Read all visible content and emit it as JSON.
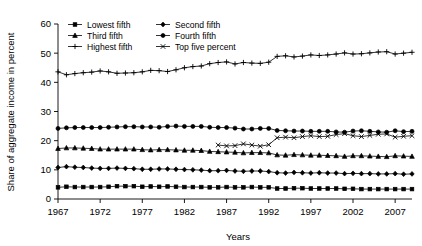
{
  "chart_data": {
    "type": "line",
    "title": "",
    "xlabel": "Years",
    "ylabel": "Share of aggregate income in percent",
    "xlim": [
      1967,
      2009
    ],
    "ylim": [
      0,
      60
    ],
    "grid": false,
    "legend_position": "top-left-inside",
    "xticks": [
      1967,
      1972,
      1977,
      1982,
      1987,
      1992,
      1997,
      2002,
      2007
    ],
    "yticks": [
      0,
      10,
      20,
      30,
      40,
      50,
      60
    ],
    "x": [
      1967,
      1968,
      1969,
      1970,
      1971,
      1972,
      1973,
      1974,
      1975,
      1976,
      1977,
      1978,
      1979,
      1980,
      1981,
      1982,
      1983,
      1984,
      1985,
      1986,
      1987,
      1988,
      1989,
      1990,
      1991,
      1992,
      1993,
      1994,
      1995,
      1996,
      1997,
      1998,
      1999,
      2000,
      2001,
      2002,
      2003,
      2004,
      2005,
      2006,
      2007,
      2008,
      2009
    ],
    "series": [
      {
        "name": "Lowest fifth",
        "marker": "square",
        "values": [
          4.0,
          4.2,
          4.1,
          4.1,
          4.1,
          4.1,
          4.2,
          4.4,
          4.4,
          4.4,
          4.2,
          4.3,
          4.2,
          4.3,
          4.2,
          4.1,
          4.1,
          4.1,
          4.0,
          4.0,
          4.1,
          4.0,
          4.0,
          4.1,
          4.0,
          4.0,
          3.6,
          3.6,
          3.7,
          3.7,
          3.6,
          3.6,
          3.6,
          3.6,
          3.5,
          3.5,
          3.4,
          3.4,
          3.4,
          3.4,
          3.4,
          3.4,
          3.4
        ]
      },
      {
        "name": "Second fifth",
        "marker": "diamond",
        "values": [
          10.8,
          11.1,
          10.9,
          10.8,
          10.6,
          10.5,
          10.5,
          10.6,
          10.5,
          10.4,
          10.2,
          10.2,
          10.3,
          10.3,
          10.2,
          10.1,
          10.0,
          9.9,
          9.7,
          9.7,
          9.8,
          9.6,
          9.5,
          9.6,
          9.6,
          9.4,
          9.0,
          8.9,
          9.1,
          9.0,
          8.9,
          9.0,
          8.9,
          8.9,
          8.7,
          8.8,
          8.7,
          8.7,
          8.6,
          8.6,
          8.7,
          8.5,
          8.6
        ]
      },
      {
        "name": "Third fifth",
        "marker": "triangle",
        "values": [
          17.3,
          17.5,
          17.5,
          17.4,
          17.3,
          17.1,
          17.1,
          17.1,
          17.1,
          17.1,
          16.9,
          16.8,
          16.9,
          16.9,
          16.8,
          16.7,
          16.7,
          16.6,
          16.3,
          16.2,
          16.1,
          16.0,
          15.8,
          15.9,
          15.9,
          15.8,
          15.1,
          15.0,
          15.2,
          15.1,
          15.0,
          15.0,
          14.9,
          14.8,
          14.6,
          14.8,
          14.8,
          14.7,
          14.6,
          14.5,
          14.8,
          14.7,
          14.6
        ]
      },
      {
        "name": "Fourth fifth",
        "marker": "circle",
        "values": [
          24.2,
          24.4,
          24.5,
          24.5,
          24.5,
          24.5,
          24.6,
          24.7,
          24.8,
          24.8,
          24.7,
          24.7,
          24.6,
          24.9,
          25.0,
          24.9,
          24.9,
          24.9,
          24.6,
          24.5,
          24.5,
          24.3,
          24.0,
          24.0,
          24.2,
          24.2,
          23.5,
          23.4,
          23.3,
          23.3,
          23.2,
          23.2,
          23.2,
          23.0,
          22.9,
          23.3,
          23.4,
          23.2,
          23.0,
          22.9,
          23.4,
          23.1,
          23.2
        ]
      },
      {
        "name": "Highest fifth",
        "marker": "plus",
        "values": [
          43.6,
          42.6,
          43.0,
          43.3,
          43.5,
          43.9,
          43.6,
          43.1,
          43.2,
          43.3,
          43.6,
          44.1,
          44.0,
          43.7,
          44.3,
          45.0,
          45.4,
          45.6,
          46.4,
          46.8,
          47.0,
          46.3,
          46.8,
          46.6,
          46.5,
          46.9,
          48.9,
          49.1,
          48.7,
          49.0,
          49.4,
          49.2,
          49.4,
          49.7,
          50.1,
          49.7,
          49.8,
          50.1,
          50.4,
          50.5,
          49.7,
          50.0,
          50.3
        ]
      },
      {
        "name": "Top five percent",
        "marker": "cross",
        "values": [
          null,
          null,
          null,
          null,
          null,
          null,
          null,
          null,
          null,
          null,
          null,
          null,
          null,
          null,
          null,
          null,
          null,
          null,
          null,
          18.5,
          18.2,
          18.3,
          18.9,
          18.5,
          18.1,
          18.6,
          21.0,
          21.2,
          21.0,
          21.4,
          21.7,
          21.4,
          21.5,
          22.1,
          22.4,
          21.7,
          21.4,
          21.8,
          22.2,
          22.3,
          21.2,
          21.5,
          21.7
        ]
      }
    ]
  },
  "legend": {
    "entries": [
      {
        "label": "Lowest fifth",
        "marker": "square"
      },
      {
        "label": "Second fifth",
        "marker": "diamond"
      },
      {
        "label": "Third fifth",
        "marker": "triangle"
      },
      {
        "label": "Fourth fifth",
        "marker": "circle"
      },
      {
        "label": "Highest fifth",
        "marker": "plus"
      },
      {
        "label": "Top five percent",
        "marker": "cross"
      }
    ]
  },
  "colors": {
    "ink": "#000000",
    "background": "#ffffff"
  }
}
